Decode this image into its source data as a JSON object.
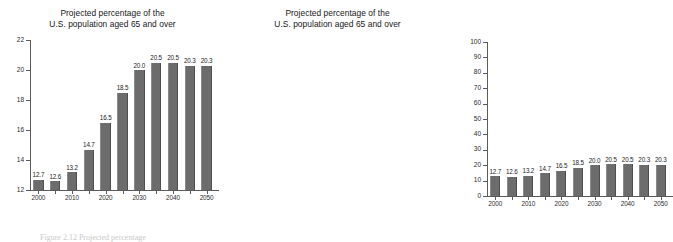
{
  "figure": {
    "caption": "Figure 2.12 Projected percentage"
  },
  "panels": [
    {
      "name": "left-panel-truncated-axis",
      "title_line1": "Projected percentage of the",
      "title_line2": "U.S. population aged 65 and over"
    },
    {
      "name": "right-panel-full-axis",
      "title_line1": "Projected percentage of the",
      "title_line2": "U.S. population aged 65 and over"
    }
  ],
  "chart_data": [
    {
      "type": "bar",
      "title": "Projected percentage of the U.S. population aged 65 and over",
      "xlabel": "",
      "ylabel": "",
      "categories": [
        "2000",
        "2005",
        "2010",
        "2015",
        "2020",
        "2025",
        "2030",
        "2035",
        "2040",
        "2045",
        "2050"
      ],
      "values": [
        12.7,
        12.6,
        13.2,
        14.7,
        16.5,
        18.5,
        20.0,
        20.5,
        20.5,
        20.3,
        20.3
      ],
      "data_labels": [
        "12.7",
        "12.6",
        "13.2",
        "14.7",
        "16.5",
        "18.5",
        "20.0",
        "20.5",
        "20.5",
        "20.3",
        "20.3"
      ],
      "xtick_labels": [
        "2000",
        "",
        "2010",
        "",
        "2020",
        "",
        "2030",
        "",
        "2040",
        "",
        "2050"
      ],
      "ylim": [
        12,
        22
      ],
      "yticks": [
        12,
        14,
        16,
        18,
        20,
        22
      ],
      "ytick_labels": [
        "12",
        "14",
        "16",
        "18",
        "20",
        "22"
      ],
      "grid": false,
      "legend": "none",
      "bar_color": "#6c6c6c",
      "axis_color": "#5b5b5b"
    },
    {
      "type": "bar",
      "title": "Projected percentage of the U.S. population aged 65 and over",
      "xlabel": "",
      "ylabel": "",
      "categories": [
        "2000",
        "2005",
        "2010",
        "2015",
        "2020",
        "2025",
        "2030",
        "2035",
        "2040",
        "2045",
        "2050"
      ],
      "values": [
        12.7,
        12.6,
        13.2,
        14.7,
        16.5,
        18.5,
        20.0,
        20.5,
        20.5,
        20.3,
        20.3
      ],
      "data_labels": [
        "12.7",
        "12.6",
        "13.2",
        "14.7",
        "16.5",
        "18.5",
        "20.0",
        "20.5",
        "20.5",
        "20.3",
        "20.3"
      ],
      "xtick_labels": [
        "2000",
        "",
        "2010",
        "",
        "2020",
        "",
        "2030",
        "",
        "2040",
        "",
        "2050"
      ],
      "ylim": [
        0,
        100
      ],
      "yticks": [
        0,
        10,
        20,
        30,
        40,
        50,
        60,
        70,
        80,
        90,
        100
      ],
      "ytick_labels": [
        "0",
        "10",
        "20",
        "30",
        "40",
        "50",
        "60",
        "70",
        "80",
        "90",
        "100"
      ],
      "grid": false,
      "legend": "none",
      "bar_color": "#6c6c6c",
      "axis_color": "#5b5b5b"
    }
  ]
}
